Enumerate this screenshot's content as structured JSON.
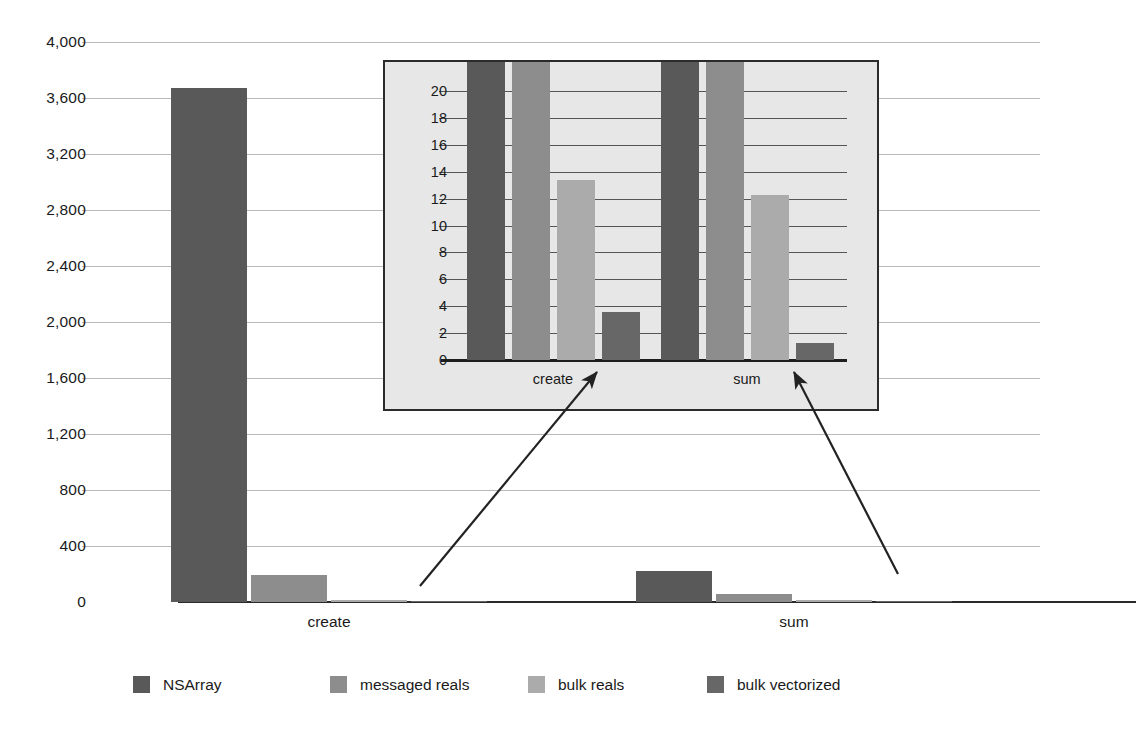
{
  "chart_data": {
    "type": "bar",
    "title": "",
    "subtitle": "",
    "xlabel": "",
    "ylabel": "",
    "categories": [
      "create",
      "sum"
    ],
    "ylim": [
      0,
      4000
    ],
    "ytick_labels": [
      "0",
      "400",
      "800",
      "1,200",
      "1,600",
      "2,000",
      "2,400",
      "2,800",
      "3,200",
      "3,600",
      "4,000"
    ],
    "ytick_values": [
      0,
      400,
      800,
      1200,
      1600,
      2000,
      2400,
      2800,
      3200,
      3600,
      4000
    ],
    "grid": true,
    "legend_position": "bottom",
    "series": [
      {
        "name": "NSArray",
        "color": "#595959",
        "values": [
          3670,
          220
        ]
      },
      {
        "name": "messaged reals",
        "color": "#8d8d8d",
        "values": [
          190,
          60
        ]
      },
      {
        "name": "bulk reals",
        "color": "#ababab",
        "values": [
          13,
          12
        ]
      },
      {
        "name": "bulk vectorized",
        "color": "#676767",
        "values": [
          3.6,
          1.3
        ]
      }
    ],
    "inset": {
      "type": "bar",
      "categories": [
        "create",
        "sum"
      ],
      "ylim": [
        0,
        20
      ],
      "ytick_labels": [
        "0",
        "2",
        "4",
        "6",
        "8",
        "10",
        "12",
        "14",
        "16",
        "18",
        "20"
      ],
      "ytick_values": [
        0,
        2,
        4,
        6,
        8,
        10,
        12,
        14,
        16,
        18,
        20
      ],
      "grid": true,
      "note": "first two series are clipped at the top of the 0-20 axis",
      "series": [
        {
          "name": "NSArray",
          "color": "#595959",
          "values": [
            20,
            20
          ],
          "clipped": [
            true,
            true
          ]
        },
        {
          "name": "messaged reals",
          "color": "#8d8d8d",
          "values": [
            20,
            20
          ],
          "clipped": [
            true,
            true
          ]
        },
        {
          "name": "bulk reals",
          "color": "#ababab",
          "values": [
            13.4,
            12.3
          ],
          "clipped": [
            false,
            false
          ]
        },
        {
          "name": "bulk vectorized",
          "color": "#676767",
          "values": [
            3.6,
            1.3
          ],
          "clipped": [
            false,
            false
          ]
        }
      ]
    },
    "annotations": [
      {
        "name": "arrow-to-create-inset",
        "from": [
          420,
          586
        ],
        "to": [
          597,
          372
        ]
      },
      {
        "name": "arrow-to-sum-inset",
        "from": [
          898,
          574
        ],
        "to": [
          794,
          372
        ]
      }
    ]
  },
  "legend": {
    "items": [
      {
        "label": "NSArray",
        "color": "#595959"
      },
      {
        "label": "messaged reals",
        "color": "#8d8d8d"
      },
      {
        "label": "bulk reals",
        "color": "#ababab"
      },
      {
        "label": "bulk vectorized",
        "color": "#676767"
      }
    ]
  },
  "colors": {
    "gridline": "#b9b9b9",
    "axis": "#2a2a2a",
    "inset_background": "#e7e7e7",
    "inset_border": "#2b2b2b",
    "text": "#1a1a1a"
  }
}
